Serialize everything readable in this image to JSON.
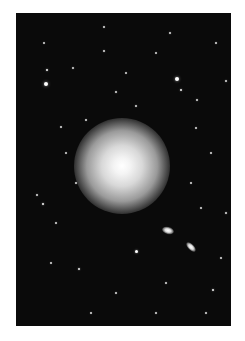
{
  "image": {
    "subject": "Elliptical galaxy in a star field",
    "background_color": "#0a0a0a",
    "frame_color": "#ffffff",
    "galaxy": {
      "cx": 106,
      "cy": 153,
      "core_radius": 14,
      "halo_radius": 48
    },
    "companions": [
      {
        "cx": 152,
        "cy": 217,
        "rx": 6,
        "ry": 3.5,
        "rotate": 15
      },
      {
        "cx": 175,
        "cy": 234,
        "rx": 6,
        "ry": 3,
        "rotate": 45
      }
    ],
    "stars": [
      [
        30,
        71,
        2.2
      ],
      [
        31,
        57,
        1.4
      ],
      [
        161,
        66,
        2
      ],
      [
        165,
        77,
        1.3
      ],
      [
        100,
        79,
        1
      ],
      [
        88,
        38,
        1
      ],
      [
        154,
        20,
        1
      ],
      [
        57,
        55,
        0.9
      ],
      [
        210,
        68,
        1
      ],
      [
        181,
        87,
        1
      ],
      [
        88,
        14,
        0.8
      ],
      [
        120,
        93,
        0.9
      ],
      [
        180,
        115,
        0.8
      ],
      [
        70,
        107,
        0.8
      ],
      [
        28,
        30,
        0.7
      ],
      [
        140,
        40,
        0.7
      ],
      [
        200,
        30,
        0.8
      ],
      [
        45,
        114,
        0.8
      ],
      [
        110,
        60,
        0.7
      ],
      [
        195,
        140,
        0.8
      ],
      [
        210,
        200,
        1
      ],
      [
        27,
        191,
        1.4
      ],
      [
        21,
        182,
        1
      ],
      [
        40,
        210,
        0.8
      ],
      [
        63,
        256,
        1.2
      ],
      [
        120,
        238,
        1.5
      ],
      [
        197,
        277,
        1.3
      ],
      [
        75,
        300,
        0.8
      ],
      [
        190,
        300,
        0.8
      ],
      [
        150,
        270,
        0.8
      ],
      [
        100,
        280,
        0.8
      ],
      [
        205,
        245,
        0.8
      ],
      [
        35,
        250,
        0.8
      ],
      [
        60,
        170,
        0.8
      ],
      [
        175,
        170,
        0.8
      ],
      [
        140,
        300,
        0.8
      ],
      [
        50,
        140,
        0.7
      ],
      [
        185,
        195,
        0.8
      ]
    ]
  }
}
